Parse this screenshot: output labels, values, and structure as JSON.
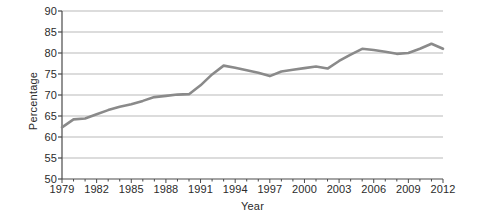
{
  "chart_data": {
    "type": "line",
    "title": "",
    "xlabel": "Year",
    "ylabel": "Percentage",
    "xlim": [
      1979,
      2012
    ],
    "ylim": [
      50,
      90
    ],
    "grid": true,
    "legend": false,
    "line_color": "#8a8a8a",
    "x_tick_labels": [
      "1979",
      "1982",
      "1985",
      "1988",
      "1991",
      "1994",
      "1997",
      "2000",
      "2003",
      "2006",
      "2009",
      "2012"
    ],
    "x_tick_values": [
      1979,
      1982,
      1985,
      1988,
      1991,
      1994,
      1997,
      2000,
      2003,
      2006,
      2009,
      2012
    ],
    "x_minor_ticks": [
      1979,
      1980,
      1981,
      1982,
      1983,
      1984,
      1985,
      1986,
      1987,
      1988,
      1989,
      1990,
      1991,
      1992,
      1993,
      1994,
      1995,
      1996,
      1997,
      1998,
      1999,
      2000,
      2001,
      2002,
      2003,
      2004,
      2005,
      2006,
      2007,
      2008,
      2009,
      2010,
      2011,
      2012
    ],
    "y_tick_labels": [
      "50",
      "55",
      "60",
      "65",
      "70",
      "75",
      "80",
      "85",
      "90"
    ],
    "y_tick_values": [
      50,
      55,
      60,
      65,
      70,
      75,
      80,
      85,
      90
    ],
    "series": [
      {
        "name": "Percentage",
        "x": [
          1979,
          1980,
          1981,
          1982,
          1983,
          1984,
          1985,
          1986,
          1987,
          1988,
          1989,
          1990,
          1991,
          1992,
          1993,
          1994,
          1995,
          1996,
          1997,
          1998,
          1999,
          2000,
          2001,
          2002,
          2003,
          2004,
          2005,
          2006,
          2007,
          2008,
          2009,
          2010,
          2011,
          2012
        ],
        "values": [
          62.3,
          64.2,
          64.4,
          65.4,
          66.4,
          67.2,
          67.8,
          68.6,
          69.5,
          69.8,
          70.1,
          70.2,
          72.3,
          74.9,
          77.0,
          76.5,
          75.9,
          75.3,
          74.5,
          75.6,
          76.0,
          76.4,
          76.8,
          76.3,
          78.1,
          79.6,
          81.0,
          80.7,
          80.3,
          79.8,
          80.0,
          81.0,
          82.2,
          81.0
        ]
      }
    ]
  }
}
